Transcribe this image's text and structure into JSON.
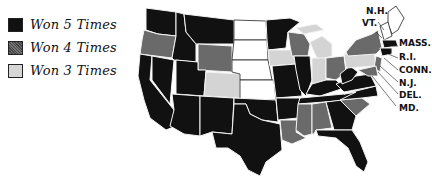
{
  "legend": {
    "items": [
      {
        "label": "Won 5 Times",
        "level": 5,
        "color": "#111111"
      },
      {
        "label": "Won 4 Times",
        "level": 4,
        "color": "#6a6a6a"
      },
      {
        "label": "Won 3 Times",
        "level": 3,
        "color": "#d4d4d4"
      }
    ]
  },
  "map": {
    "states": [
      {
        "abbr": "WASH.",
        "level": 5
      },
      {
        "abbr": "ORE.",
        "level": 4
      },
      {
        "abbr": "CALIF.",
        "level": 5
      },
      {
        "abbr": "NEV.",
        "level": 5
      },
      {
        "abbr": "IDAHO",
        "level": 5
      },
      {
        "abbr": "MONT.",
        "level": 5
      },
      {
        "abbr": "WYO.",
        "level": 4
      },
      {
        "abbr": "UTAH",
        "level": 5
      },
      {
        "abbr": "ARIZ.",
        "level": 5
      },
      {
        "abbr": "COLO.",
        "level": 3
      },
      {
        "abbr": "N.M.",
        "level": 5
      },
      {
        "abbr": "N.D.",
        "level": 0
      },
      {
        "abbr": "S.D.",
        "level": 0
      },
      {
        "abbr": "NEB.",
        "level": 0
      },
      {
        "abbr": "KAN.",
        "level": 0
      },
      {
        "abbr": "OKLA.",
        "level": 5
      },
      {
        "abbr": "TEXAS",
        "level": 5
      },
      {
        "abbr": "MINN.",
        "level": 5
      },
      {
        "abbr": "IOWA",
        "level": 3
      },
      {
        "abbr": "MO.",
        "level": 5
      },
      {
        "abbr": "ARK.",
        "level": 5
      },
      {
        "abbr": "LA.",
        "level": 4
      },
      {
        "abbr": "WIS.",
        "level": 4
      },
      {
        "abbr": "ILL.",
        "level": 5
      },
      {
        "abbr": "MICH.",
        "level": 3
      },
      {
        "abbr": "IND.",
        "level": 3
      },
      {
        "abbr": "OHIO",
        "level": 4
      },
      {
        "abbr": "KY.",
        "level": 5
      },
      {
        "abbr": "TENN.",
        "level": 5
      },
      {
        "abbr": "MISS.",
        "level": 4
      },
      {
        "abbr": "ALA.",
        "level": 4
      },
      {
        "abbr": "GA.",
        "level": 5
      },
      {
        "abbr": "FLA.",
        "level": 5
      },
      {
        "abbr": "S.C.",
        "level": 4
      },
      {
        "abbr": "N.C.",
        "level": 5
      },
      {
        "abbr": "VA.",
        "level": 5
      },
      {
        "abbr": "W.VA.",
        "level": 5
      },
      {
        "abbr": "PA.",
        "level": 3
      },
      {
        "abbr": "N.Y.",
        "level": 4
      },
      {
        "abbr": "ME.",
        "level": 0
      }
    ],
    "callouts": [
      "N.H.",
      "VT.",
      "MASS.",
      "R.I.",
      "CONN.",
      "N.J.",
      "DEL.",
      "MD."
    ]
  }
}
